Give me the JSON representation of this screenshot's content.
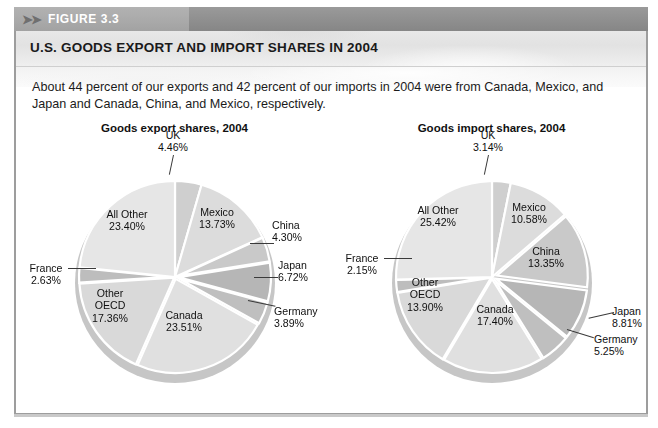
{
  "figure": {
    "badge": "FIGURE 3.3",
    "arrows_icon": "double-chevron-right-icon",
    "title": "U.S. GOODS EXPORT AND IMPORT SHARES IN 2004",
    "description": "About 44 percent of our exports and 42 percent of our imports in 2004 were from Canada, Mexico, and Japan and Canada, China, and Mexico, respectively."
  },
  "colors": {
    "banner": "#8f8f8f",
    "tab": "#a9a9a9",
    "border": "#9d9d9d",
    "title_band": "#e6e6e6",
    "slice_light": "#e3e3e3",
    "slice_mid": "#d2d2d2",
    "slice_dark": "#b4b4b4",
    "shadow": "#c6c6c6",
    "text": "#101010"
  },
  "chart_data": [
    {
      "type": "pie",
      "id": "export",
      "title": "Goods export shares, 2004",
      "unit": "%",
      "start_angle_deg": 0,
      "direction": "clockwise",
      "categories": [
        "UK",
        "Mexico",
        "China",
        "Japan",
        "Germany",
        "Canada",
        "Other OECD",
        "France",
        "All Other"
      ],
      "values": [
        4.46,
        13.73,
        4.3,
        6.72,
        3.89,
        23.51,
        17.36,
        2.63,
        23.4
      ],
      "labels": [
        {
          "name": "UK",
          "value": "4.46%",
          "text": "UK\n4.46%"
        },
        {
          "name": "Mexico",
          "value": "13.73%",
          "text": "Mexico\n13.73%"
        },
        {
          "name": "China",
          "value": "4.30%",
          "text": "China\n4.30%"
        },
        {
          "name": "Japan",
          "value": "6.72%",
          "text": "Japan\n6.72%"
        },
        {
          "name": "Germany",
          "value": "3.89%",
          "text": "Germany\n3.89%"
        },
        {
          "name": "Canada",
          "value": "23.51%",
          "text": "Canada\n23.51%"
        },
        {
          "name": "Other OECD",
          "value": "17.36%",
          "text": "Other\nOECD\n17.36%"
        },
        {
          "name": "France",
          "value": "2.63%",
          "text": "France\n2.63%"
        },
        {
          "name": "All Other",
          "value": "23.40%",
          "text": "All Other\n23.40%"
        }
      ]
    },
    {
      "type": "pie",
      "id": "import",
      "title": "Goods import shares, 2004",
      "unit": "%",
      "start_angle_deg": 0,
      "direction": "clockwise",
      "categories": [
        "UK",
        "Mexico",
        "China",
        "Japan",
        "Germany",
        "Canada",
        "Other OECD",
        "France",
        "All Other"
      ],
      "values": [
        3.14,
        10.58,
        13.35,
        8.81,
        5.25,
        17.4,
        13.9,
        2.15,
        25.42
      ],
      "labels": [
        {
          "name": "UK",
          "value": "3.14%",
          "text": "UK\n3.14%"
        },
        {
          "name": "Mexico",
          "value": "10.58%",
          "text": "Mexico\n10.58%"
        },
        {
          "name": "China",
          "value": "13.35%",
          "text": "China\n13.35%"
        },
        {
          "name": "Japan",
          "value": "8.81%",
          "text": "Japan\n8.81%"
        },
        {
          "name": "Germany",
          "value": "5.25%",
          "text": "Germany\n5.25%"
        },
        {
          "name": "Canada",
          "value": "17.40%",
          "text": "Canada\n17.40%"
        },
        {
          "name": "Other OECD",
          "value": "13.90%",
          "text": "Other\nOECD\n13.90%"
        },
        {
          "name": "France",
          "value": "2.15%",
          "text": "France\n2.15%"
        },
        {
          "name": "All Other",
          "value": "25.42%",
          "text": "All Other\n25.42%"
        }
      ]
    }
  ]
}
